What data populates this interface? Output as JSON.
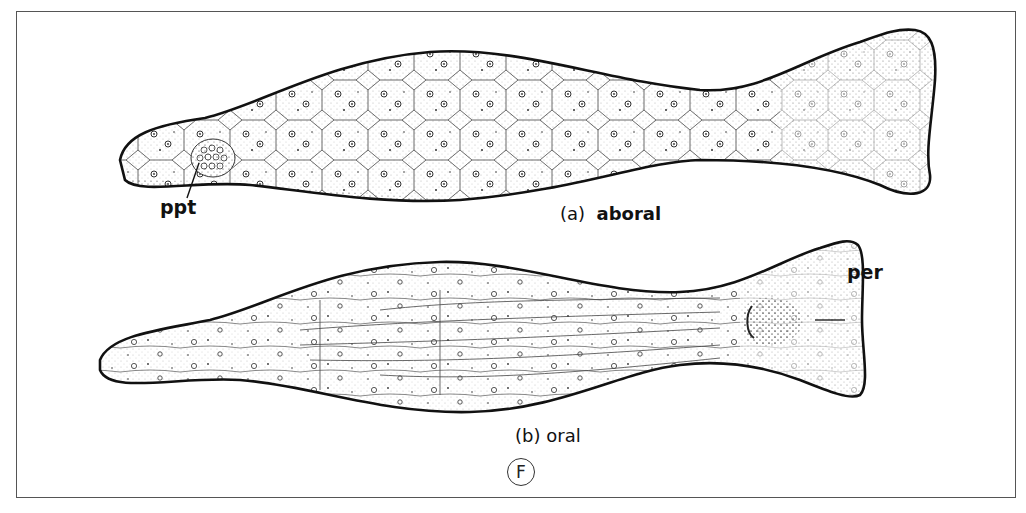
{
  "figure": {
    "id_label": "F",
    "panels": [
      {
        "key": "a",
        "caption_prefix": "(a)",
        "caption": "aboral",
        "annotations": [
          {
            "label": "ppt"
          }
        ]
      },
      {
        "key": "b",
        "caption_prefix": "(b)",
        "caption": "oral",
        "annotations": [
          {
            "label": "per"
          }
        ]
      }
    ]
  },
  "colors": {
    "ink": "#111111",
    "background": "#ffffff",
    "frame": "#555555"
  }
}
